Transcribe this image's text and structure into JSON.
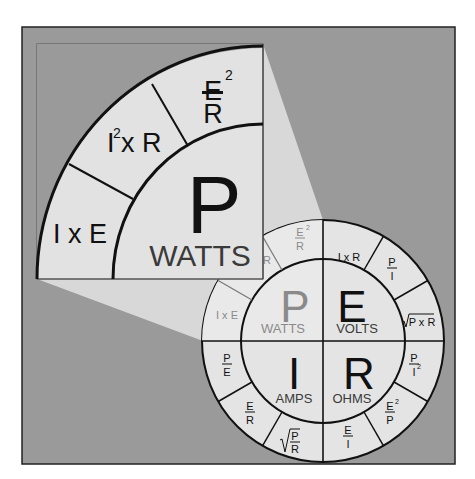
{
  "colors": {
    "background": "#9a9a9a",
    "light_fill": "#e2e2e2",
    "beam_fill": "#d6d6d6",
    "line": "#111111",
    "faded_text": "#8a8a8a"
  },
  "magnified": {
    "big_letter": "P",
    "unit": "WATTS",
    "segments": [
      {
        "id": "ixe",
        "main": "I x E"
      },
      {
        "id": "i2r",
        "base": "I",
        "sup": "2",
        "rest": "x R"
      },
      {
        "id": "e2r",
        "num": "E",
        "sup": "2",
        "den": "R"
      }
    ]
  },
  "wheel": {
    "quadrants": [
      {
        "id": "P",
        "letter": "P",
        "unit": "WATTS"
      },
      {
        "id": "E",
        "letter": "E",
        "unit": "VOLTS"
      },
      {
        "id": "I",
        "letter": "I",
        "unit": "AMPS"
      },
      {
        "id": "R",
        "letter": "R",
        "unit": "OHMS"
      }
    ],
    "P_formulas": {
      "ixe": "I x E",
      "i2r_partial": "R",
      "e2r_num": "E",
      "e2r_sup": "2",
      "e2r_den": "R"
    },
    "E_formulas": {
      "ixr": "I x R",
      "pi_num": "P",
      "pi_den": "I",
      "sqrt_pr": "P x R"
    },
    "R_formulas": {
      "pi2_num": "P",
      "pi2_den": "I",
      "pi2_sup": "2",
      "e2p_num": "E",
      "e2p_sup": "2",
      "e2p_den": "P",
      "ei_num": "E",
      "ei_den": "I"
    },
    "I_formulas": {
      "pe_num": "P",
      "pe_den": "E",
      "er_num": "E",
      "er_den": "R",
      "sqrt_pr_num": "P",
      "sqrt_pr_den": "R"
    }
  }
}
